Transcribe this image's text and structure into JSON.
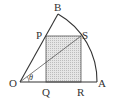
{
  "diagram": {
    "type": "geometry",
    "colors": {
      "stroke": "#333333",
      "fill_rect": "#d9d9d9",
      "background": "#ffffff"
    },
    "points": {
      "O": {
        "label": "O",
        "x": 20,
        "y": 82
      },
      "A": {
        "label": "A",
        "x": 97,
        "y": 82
      },
      "B": {
        "label": "B",
        "x": 58,
        "y": 14
      },
      "P": {
        "label": "P",
        "x": 46,
        "y": 36
      },
      "Q": {
        "label": "Q",
        "x": 46,
        "y": 82
      },
      "R": {
        "label": "R",
        "x": 81,
        "y": 82
      },
      "S": {
        "label": "S",
        "x": 81,
        "y": 36
      }
    },
    "angle_label": "θ"
  }
}
